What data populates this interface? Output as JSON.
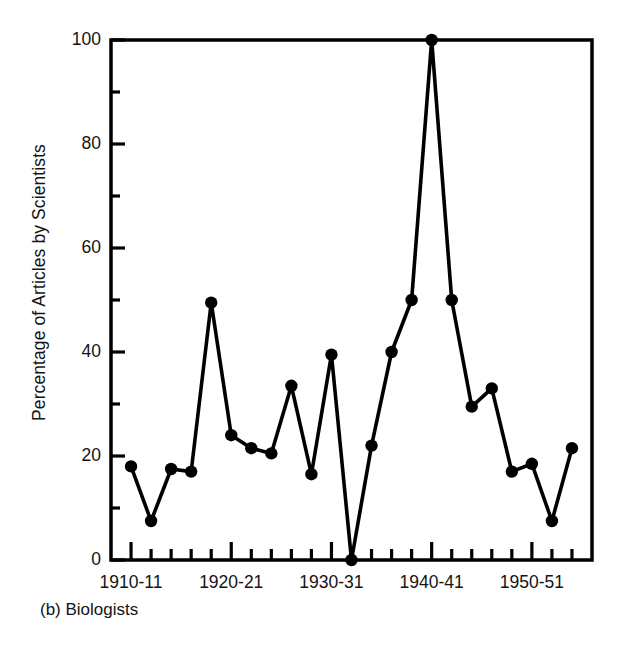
{
  "figure": {
    "caption": "(b) Biologists",
    "ylabel": "Percentage of Articles by Scientists"
  },
  "axes": {
    "y_major_labels": [
      "0",
      "20",
      "40",
      "60",
      "80",
      "100"
    ],
    "x_major_labels": [
      "1910-11",
      "1920-21",
      "1930-31",
      "1940-41",
      "1950-51"
    ]
  },
  "chart_data": {
    "type": "line",
    "title": "(b) Biologists",
    "xlabel": "",
    "ylabel": "Percentage of Articles by Scientists",
    "ylim": [
      0,
      100
    ],
    "ytick_major": [
      0,
      20,
      40,
      60,
      80,
      100
    ],
    "ytick_minor": [
      10,
      30,
      50,
      70,
      90
    ],
    "xlim": [
      "1908-09",
      "1956-57"
    ],
    "grid": false,
    "legend": null,
    "marker": "filled-circle",
    "line_color": "#000000",
    "categories": [
      "1910-11",
      "1912-13",
      "1914-15",
      "1916-17",
      "1918-19",
      "1920-21",
      "1922-23",
      "1924-25",
      "1926-27",
      "1928-29",
      "1930-31",
      "1932-33",
      "1934-35",
      "1936-37",
      "1938-39",
      "1940-41",
      "1942-43",
      "1944-45",
      "1946-47",
      "1948-49",
      "1950-51",
      "1952-53",
      "1954-55"
    ],
    "values": [
      18,
      7.5,
      17.5,
      17,
      49.5,
      24,
      21.5,
      20.5,
      33.5,
      16.5,
      39.5,
      0,
      22,
      40,
      50,
      100,
      50,
      29.5,
      33,
      17,
      18.5,
      7.5,
      21.5
    ],
    "xtick_major_categories": [
      "1910-11",
      "1920-21",
      "1930-31",
      "1940-41",
      "1950-51"
    ]
  }
}
